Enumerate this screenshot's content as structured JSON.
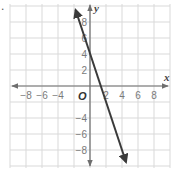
{
  "chart_data": {
    "type": "line",
    "title": "",
    "xlabel": "x",
    "ylabel": "y",
    "origin_label": "O",
    "xlim": [
      -10,
      10
    ],
    "ylim": [
      -10,
      10
    ],
    "grid": true,
    "grid_step": 2,
    "x_tick_labels": [
      "−8",
      "−6",
      "−4",
      "2",
      "4",
      "6",
      "8"
    ],
    "x_tick_values": [
      -8,
      -6,
      -4,
      2,
      4,
      6,
      8
    ],
    "y_tick_labels": [
      "8",
      "6",
      "4",
      "2",
      "−4",
      "−6",
      "−8"
    ],
    "y_tick_values": [
      8,
      6,
      4,
      2,
      -4,
      -6,
      -8
    ],
    "series": [
      {
        "name": "line",
        "slope": -3,
        "y_intercept": 4,
        "x_intercept": 1.33,
        "x": [
          -1.8,
          0,
          1.33,
          4.5
        ],
        "y": [
          9.5,
          4,
          0,
          -9.5
        ],
        "arrows": "both",
        "color": "#3a3a3a"
      }
    ],
    "colors": {
      "grid": "#d9d9d9",
      "axis": "#6e6e6e",
      "line": "#3a3a3a",
      "tick_text": "#7a7a7a"
    }
  },
  "corner_mark": "."
}
